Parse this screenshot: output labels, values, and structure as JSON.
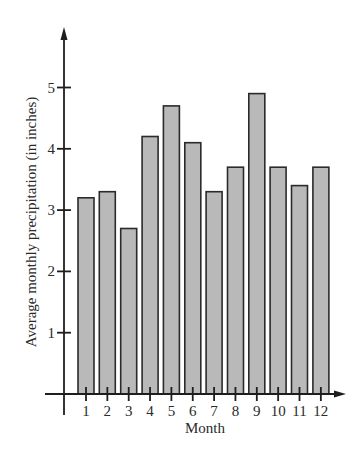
{
  "chart_data": {
    "type": "bar",
    "title": "",
    "xlabel": "Month",
    "ylabel": "Average monthly precipitation (in inches)",
    "categories": [
      "1",
      "2",
      "3",
      "4",
      "5",
      "6",
      "7",
      "8",
      "9",
      "10",
      "11",
      "12"
    ],
    "values": [
      3.2,
      3.3,
      2.7,
      4.2,
      4.7,
      4.1,
      3.3,
      3.7,
      4.9,
      3.7,
      3.4,
      3.7
    ],
    "yticks": [
      1,
      2,
      3,
      4,
      5
    ],
    "ylim": [
      0,
      5.9
    ],
    "grid": false,
    "legend": null,
    "bar_color": "#b9b9b9",
    "bar_edge_color": "#2b2b2b"
  },
  "layout": {
    "origin_x": 64,
    "origin_y": 394,
    "px_per_unit": 61.3,
    "first_month_x": 86,
    "month_spacing": 21.35,
    "bar_width": 16,
    "y_axis_top": 27,
    "y_axis_bottom": 415,
    "x_axis_left": 45,
    "x_axis_right": 346
  }
}
